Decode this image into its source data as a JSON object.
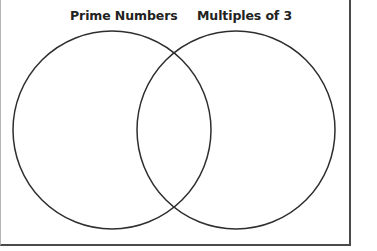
{
  "diagram": {
    "type": "venn",
    "sets": [
      {
        "id": "A",
        "label": "Prime Numbers",
        "circle": {
          "cx": 112,
          "cy": 130,
          "r": 99
        }
      },
      {
        "id": "B",
        "label": "Multiples of 3",
        "circle": {
          "cx": 236,
          "cy": 130,
          "r": 99
        }
      }
    ],
    "regions": {
      "only_A": [],
      "A_and_B": [],
      "only_B": [],
      "outside": []
    },
    "colors": {
      "circle_stroke": "#2e2e2e",
      "frame_border": "#4a4a4a",
      "background": "#ffffff",
      "label_text": "#222222"
    }
  }
}
